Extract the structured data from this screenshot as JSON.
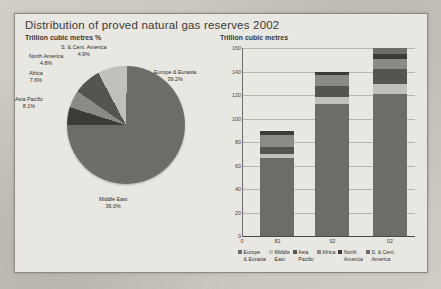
{
  "title": "Distribution of proved natural gas reserves 2002",
  "pie_panel": {
    "subtitle": "Trillion cubic metres %"
  },
  "bar_panel": {
    "subtitle": "Trillion cubic metres"
  },
  "colors": {
    "europe_eurasia": "#6e6c69",
    "middle_east": "#6e6c69",
    "asia_pacific": "#c2c0bb",
    "africa": "#56544f",
    "north_america": "#8c8a85",
    "s_cent_america": "#3d3b38",
    "axis": "#46443f",
    "grid": "#b9b5ae",
    "paper": "#e9e7e2"
  },
  "chart_data": [
    {
      "type": "pie",
      "title": "Distribution of proved natural gas reserves 2002",
      "subtitle": "Trillion cubic metres %",
      "unit": "%",
      "labels": [
        "Europe & Eurasia",
        "Middle East",
        "Asia Pacific",
        "Africa",
        "North America",
        "S. & Cent. America"
      ],
      "values": [
        39.2,
        36.0,
        8.1,
        7.6,
        4.8,
        4.9
      ],
      "slices": [
        {
          "label": "Europe & Eurasia",
          "value": 39.2,
          "value_text": "39.2%",
          "color": "#6e6c69"
        },
        {
          "label": "Middle East",
          "value": 36.0,
          "value_text": "36.0%",
          "color": "#6e6c69"
        },
        {
          "label": "Asia Pacific",
          "value": 8.1,
          "value_text": "8.1%",
          "color": "#c2c0bb"
        },
        {
          "label": "Africa",
          "value": 7.6,
          "value_text": "7.6%",
          "color": "#56544f"
        },
        {
          "label": "North America",
          "value": 4.8,
          "value_text": "4.8%",
          "color": "#8c8a85"
        },
        {
          "label": "S. & Cent. America",
          "value": 4.9,
          "value_text": "4.9%",
          "color": "#3d3b38"
        }
      ],
      "legend": "labels on slices"
    },
    {
      "type": "bar",
      "subtitle": "Trillion cubic metres",
      "stacked": true,
      "categories": [
        "82",
        "92",
        "02"
      ],
      "xlabel": "",
      "ylabel": "Trillion cubic metres",
      "ylim": [
        0,
        160
      ],
      "yticks": [
        0,
        20,
        40,
        60,
        80,
        100,
        120,
        140,
        160
      ],
      "ytick_labels": [
        "0",
        "20",
        "40",
        "60",
        "80",
        "100",
        "120",
        "140",
        "160"
      ],
      "grid": true,
      "legend_position": "bottom",
      "series": [
        {
          "name": "Europe & Eurasia",
          "color": "#6e6c69",
          "values": [
            66,
            112,
            121
          ]
        },
        {
          "name": "Middle East",
          "color": "#c2c0bb",
          "values": [
            4,
            6,
            8
          ]
        },
        {
          "name": "Asia Pacific",
          "color": "#56544f",
          "values": [
            6,
            10,
            13
          ]
        },
        {
          "name": "Africa",
          "color": "#8c8a85",
          "values": [
            10,
            9,
            9
          ]
        },
        {
          "name": "North America",
          "color": "#3d3b38",
          "values": [
            3,
            3,
            4
          ]
        },
        {
          "name": "S. & Cent. America",
          "color": "#6e6c69",
          "values": [
            0,
            0,
            5
          ]
        }
      ],
      "totals": [
        89,
        140,
        160
      ]
    }
  ],
  "bar_legend": [
    {
      "label": "Europe\n& Eurasia",
      "color": "#6e6c69"
    },
    {
      "label": "Middle\nEast",
      "color": "#c2c0bb"
    },
    {
      "label": "Asia\nPacific",
      "color": "#56544f"
    },
    {
      "label": "Africa",
      "color": "#8c8a85"
    },
    {
      "label": "North\nAmerica",
      "color": "#3d3b38"
    },
    {
      "label": "S. & Cent.\nAmerica",
      "color": "#6e6c69"
    }
  ]
}
